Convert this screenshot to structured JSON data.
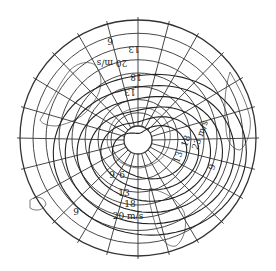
{
  "map": {
    "projection": "polar-stereographic",
    "hemisphere": "southern",
    "graticule": {
      "meridian_step_deg": 15,
      "parallel_count": 7
    },
    "isotach_unit": "m/s",
    "isotach_levels": [
      6,
      9,
      13,
      18,
      20,
      23
    ],
    "labels": [
      {
        "id": "top-6",
        "text": "6",
        "rotate": 180
      },
      {
        "id": "top-13",
        "text": "13",
        "rotate": 180
      },
      {
        "id": "top-20ms",
        "text": "20 m/s",
        "rotate": 180
      },
      {
        "id": "top-18",
        "text": "18",
        "rotate": 180
      },
      {
        "id": "top-13b",
        "text": "13",
        "rotate": 180
      },
      {
        "id": "right-13",
        "text": "13",
        "rotate": -70
      },
      {
        "id": "right-18",
        "text": "18",
        "rotate": -70
      },
      {
        "id": "right-23ms",
        "text": "23 m/s",
        "rotate": -70
      },
      {
        "id": "right-9",
        "text": "9",
        "rotate": -70
      },
      {
        "id": "bottom-9",
        "text": "9",
        "rotate": 0
      },
      {
        "id": "bottom-6",
        "text": "6",
        "rotate": 0
      },
      {
        "id": "bottom-13",
        "text": "13",
        "rotate": 0
      },
      {
        "id": "bottom-18",
        "text": "18",
        "rotate": 0
      },
      {
        "id": "bottom-20ms",
        "text": "20 m/s",
        "rotate": 0
      },
      {
        "id": "left-9",
        "text": "9",
        "rotate": 0
      }
    ]
  }
}
